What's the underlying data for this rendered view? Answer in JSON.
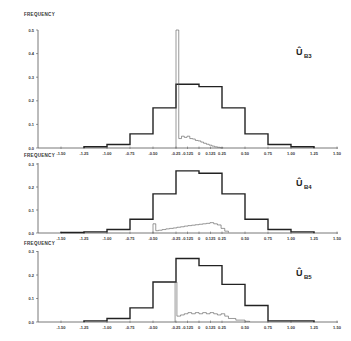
{
  "figure": {
    "ylabel": "FREQUENCY"
  },
  "chart_data": [
    {
      "type": "bar",
      "title": "Û B3",
      "panel_label": "Û",
      "panel_sub": "B3",
      "ylabel": "FREQUENCY",
      "xlabel": "",
      "ylim": [
        0.0,
        0.5
      ],
      "yticks": [
        "0.0",
        "0.1",
        "0.2",
        "0.3",
        "0.4",
        "0.5"
      ],
      "xlim": [
        -1.5,
        1.5
      ],
      "xticks": [
        "-1.50",
        "-1.25",
        "-1.00",
        "-0.75",
        "-0.50",
        "-0.25",
        "-0.125",
        "0",
        "0.125",
        "0.25",
        "0.50",
        "0.75",
        "1.00",
        "1.25",
        "1.50"
      ],
      "series": [
        {
          "name": "coarse histogram (bold)",
          "bin_edges": [
            -1.25,
            -1.0,
            -0.75,
            -0.5,
            -0.25,
            0.0,
            0.25,
            0.5,
            0.75,
            1.0,
            1.25
          ],
          "values": [
            0.005,
            0.015,
            0.06,
            0.17,
            0.27,
            0.26,
            0.17,
            0.06,
            0.015,
            0.005
          ]
        },
        {
          "name": "fine histogram (thin)",
          "bin_edges": [
            -0.25,
            -0.22,
            -0.19,
            -0.16,
            -0.13,
            -0.1,
            -0.07,
            -0.04,
            -0.01,
            0.02,
            0.05,
            0.08,
            0.11,
            0.14,
            0.17,
            0.2,
            0.23,
            0.26
          ],
          "values": [
            0.5,
            0.04,
            0.05,
            0.045,
            0.05,
            0.04,
            0.038,
            0.032,
            0.03,
            0.025,
            0.02,
            0.016,
            0.012,
            0.008,
            0.005,
            0.003,
            0.001
          ]
        }
      ]
    },
    {
      "type": "bar",
      "title": "Û B4",
      "panel_label": "Û",
      "panel_sub": "B4",
      "ylabel": "FREQUENCY",
      "xlabel": "",
      "ylim": [
        0.0,
        0.3
      ],
      "yticks": [
        "0.0",
        "0.1",
        "0.2",
        "0.3"
      ],
      "xlim": [
        -1.5,
        1.5
      ],
      "xticks": [
        "-1.50",
        "-1.25",
        "-1.00",
        "-0.75",
        "-0.50",
        "-0.25",
        "-0.125",
        "0",
        "0.125",
        "0.25",
        "0.50",
        "0.75",
        "1.00",
        "1.25",
        "1.50"
      ],
      "series": [
        {
          "name": "coarse histogram (bold)",
          "bin_edges": [
            -1.5,
            -1.25,
            -1.0,
            -0.75,
            -0.5,
            -0.25,
            0.0,
            0.25,
            0.5,
            0.75,
            1.0,
            1.25
          ],
          "values": [
            0.002,
            0.005,
            0.015,
            0.06,
            0.17,
            0.27,
            0.26,
            0.17,
            0.06,
            0.015,
            0.005
          ]
        },
        {
          "name": "fine histogram (thin)",
          "bin_edges": [
            -0.5,
            -0.47,
            -0.44,
            -0.4,
            -0.36,
            -0.32,
            -0.28,
            -0.24,
            -0.2,
            -0.16,
            -0.12,
            -0.08,
            -0.04,
            0.0,
            0.04,
            0.08,
            0.12,
            0.16,
            0.2,
            0.24,
            0.28,
            0.32
          ],
          "values": [
            0.04,
            0.01,
            0.012,
            0.015,
            0.018,
            0.02,
            0.022,
            0.025,
            0.027,
            0.03,
            0.032,
            0.034,
            0.036,
            0.038,
            0.04,
            0.042,
            0.045,
            0.04,
            0.035,
            0.02,
            0.008,
            0.002
          ]
        }
      ]
    },
    {
      "type": "bar",
      "title": "Û B5",
      "panel_label": "Û",
      "panel_sub": "B5",
      "ylabel": "FREQUENCY",
      "xlabel": "",
      "ylim": [
        0.0,
        0.3
      ],
      "yticks": [
        "0.0",
        "0.1",
        "0.2",
        "0.3"
      ],
      "xlim": [
        -1.5,
        1.5
      ],
      "xticks": [
        "-1.50",
        "-1.25",
        "-1.00",
        "-0.75",
        "-0.50",
        "-0.25",
        "-0.125",
        "0",
        "0.125",
        "0.25",
        "0.50",
        "0.75",
        "1.00",
        "1.25",
        "1.50"
      ],
      "series": [
        {
          "name": "coarse histogram (bold)",
          "bin_edges": [
            -1.25,
            -1.0,
            -0.75,
            -0.5,
            -0.25,
            0.0,
            0.25,
            0.5,
            0.75,
            1.0,
            1.25
          ],
          "values": [
            0.005,
            0.015,
            0.06,
            0.17,
            0.27,
            0.24,
            0.16,
            0.07,
            0.005,
            0.005
          ]
        },
        {
          "name": "fine histogram (thin)",
          "bin_edges": [
            -0.26,
            -0.24,
            -0.2,
            -0.16,
            -0.12,
            -0.08,
            -0.04,
            0.0,
            0.04,
            0.08,
            0.12,
            0.16,
            0.2,
            0.24,
            0.28,
            0.32,
            0.4,
            0.5,
            0.55
          ],
          "values": [
            0.17,
            0.025,
            0.03,
            0.035,
            0.04,
            0.035,
            0.04,
            0.035,
            0.04,
            0.035,
            0.04,
            0.035,
            0.03,
            0.035,
            0.025,
            0.015,
            0.008,
            0.003
          ]
        }
      ]
    }
  ]
}
